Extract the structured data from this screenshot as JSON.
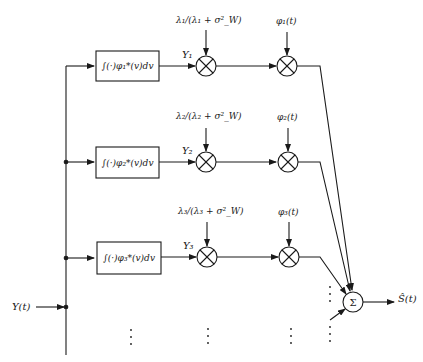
{
  "diagram": {
    "type": "block-diagram",
    "input_label": "Y(t)",
    "output_label": "Ŝ(t)",
    "summer_label": "Σ",
    "branches": [
      {
        "correlator_label": "∫(·)φ₁*(v)dv",
        "coefficient_output": "Y₁",
        "gain_label": "λ₁/(λ₁ + σ²_W)",
        "basis_label": "φ₁(t)"
      },
      {
        "correlator_label": "∫(·)φ₂*(v)dv",
        "coefficient_output": "Y₂",
        "gain_label": "λ₂/(λ₂ + σ²_W)",
        "basis_label": "φ₂(t)"
      },
      {
        "correlator_label": "∫(·)φ₃*(v)dv",
        "coefficient_output": "Y₃",
        "gain_label": "λ₃/(λ₃ + σ²_W)",
        "basis_label": "φ₃(t)"
      }
    ],
    "continuation": "⋮",
    "colors": {
      "line": "#1a1a1a",
      "background": "#ffffff"
    }
  }
}
